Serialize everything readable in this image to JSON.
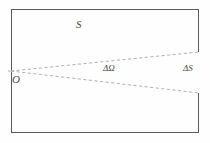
{
  "figure": {
    "background_color": "#fefefe",
    "border_color": "#5a5a5a",
    "dashed_line_color": "#b0b0b0",
    "label_color": "#4a4a4a",
    "labels": {
      "surface": "S",
      "origin": "O",
      "solid_angle": "ΔΩ",
      "surface_element": "ΔS"
    },
    "geometry": {
      "rect": {
        "x": 11,
        "y": 9,
        "width": 188,
        "height": 124
      },
      "apex": {
        "x": 11,
        "y": 71
      },
      "upper_ray_end": {
        "x": 199,
        "y": 52
      },
      "lower_ray_end": {
        "x": 199,
        "y": 93
      },
      "right_edge_gap": {
        "from_y": 52,
        "to_y": 93
      }
    }
  }
}
